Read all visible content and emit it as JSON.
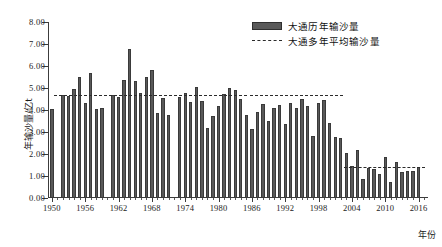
{
  "chart_data": {
    "type": "bar",
    "title": "",
    "xlabel": "年份",
    "ylabel": "年输沙量/亿t",
    "ylim": [
      0,
      8
    ],
    "xlim": [
      1949.3,
      2017.7
    ],
    "grid": false,
    "legend_position": "top-right",
    "y_ticks": [
      "0.00",
      "1.00",
      "2.00",
      "3.00",
      "4.00",
      "5.00",
      "6.00",
      "7.00",
      "8.00"
    ],
    "y_tick_values": [
      0,
      1,
      2,
      3,
      4,
      5,
      6,
      7,
      8
    ],
    "x_ticks": [
      "1950",
      "1956",
      "1962",
      "1968",
      "1974",
      "1980",
      "1986",
      "1992",
      "1998",
      "2004",
      "2010",
      "2016"
    ],
    "x_tick_values": [
      1950,
      1956,
      1962,
      1968,
      1974,
      1980,
      1986,
      1992,
      1998,
      2004,
      2010,
      2016
    ],
    "categories": [
      1950,
      1951,
      1952,
      1953,
      1954,
      1955,
      1956,
      1957,
      1958,
      1959,
      1960,
      1961,
      1962,
      1963,
      1964,
      1965,
      1966,
      1967,
      1968,
      1969,
      1970,
      1971,
      1972,
      1973,
      1974,
      1975,
      1976,
      1977,
      1978,
      1979,
      1980,
      1981,
      1982,
      1983,
      1984,
      1985,
      1986,
      1987,
      1988,
      1989,
      1990,
      1991,
      1992,
      1993,
      1994,
      1995,
      1996,
      1997,
      1998,
      1999,
      2000,
      2001,
      2002,
      2003,
      2004,
      2005,
      2006,
      2007,
      2008,
      2009,
      2010,
      2011,
      2012,
      2013,
      2014,
      2015,
      2016,
      2017
    ],
    "series": [
      {
        "name": "大通历年输沙量",
        "color": "#595959",
        "values": [
          4.05,
          0,
          4.67,
          4.64,
          4.95,
          5.5,
          4.3,
          5.67,
          4.04,
          4.09,
          0,
          4.67,
          4.57,
          5.35,
          6.78,
          5.3,
          4.77,
          5.52,
          5.82,
          3.88,
          4.53,
          3.77,
          0,
          4.61,
          4.78,
          4.38,
          5.03,
          4.4,
          3.17,
          3.74,
          4.2,
          4.75,
          5.02,
          4.9,
          4.5,
          3.77,
          3.14,
          3.9,
          4.27,
          3.52,
          4.1,
          4.21,
          3.37,
          4.34,
          4.1,
          4.51,
          4.18,
          2.82,
          4.34,
          4.45,
          3.39,
          2.76,
          2.75,
          2.06,
          1.47,
          2.16,
          0.85,
          1.38,
          1.3,
          1.11,
          1.85,
          0.72,
          1.62,
          1.17,
          1.25,
          1.21,
          1.42,
          0
        ]
      }
    ],
    "average_lines": [
      {
        "name": "大通多年平均输沙量",
        "value": 4.68,
        "x_start": 1950.3,
        "x_end": 1985.2,
        "style": "dashed"
      },
      {
        "name": "大通多年平均输沙量",
        "value": 4.68,
        "x_start": 1985.6,
        "x_end": 2002.4,
        "style": "dashed"
      },
      {
        "name": "大通多年平均输沙量",
        "value": 1.4,
        "x_start": 2002.6,
        "x_end": 2017.2,
        "style": "dashed"
      }
    ]
  },
  "legend": {
    "items": [
      {
        "label": "大通历年输沙量",
        "type": "bar"
      },
      {
        "label": "大通多年平均输沙量",
        "type": "dashed-line"
      }
    ]
  },
  "axes": {
    "y_title": "年输沙量/亿t",
    "x_title": "年份"
  }
}
